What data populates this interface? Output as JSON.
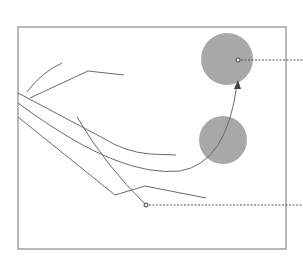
{
  "diagram": {
    "type": "line-drawing",
    "background": "#ffffff",
    "colors": {
      "frame": "#8a8a8a",
      "line": "#6a6a6a",
      "circle_fill": "#a8a8a8",
      "dash": "#555555",
      "dot_stroke": "#333333"
    },
    "frame": {
      "x": 18,
      "y": 27,
      "width": 268,
      "height": 222
    },
    "circles": [
      {
        "name": "upper-circle",
        "cx": 227,
        "cy": 59,
        "r": 26
      },
      {
        "name": "lower-circle",
        "cx": 223,
        "cy": 140,
        "r": 24
      }
    ],
    "lines": [
      {
        "name": "short-curve",
        "d": "M27,92 Q42,72 62,63"
      },
      {
        "name": "bent-polyline-top",
        "d": "M30,98 L88,71 L124,75"
      },
      {
        "name": "upper-sweep-curve",
        "d": "M18,93 L103,138 Q125,152 150,154 L176,155"
      },
      {
        "name": "arrow-curve",
        "d": "M18,103 Q75,145 115,160 Q150,174 180,171 Q227,163 237,84"
      },
      {
        "name": "lower-polyline",
        "d": "M18,117 L115,195 L145,186 L206,198"
      },
      {
        "name": "diagonal-line",
        "d": "M77,117 Q105,165 146,205"
      }
    ],
    "arrow": {
      "name": "arrowhead",
      "tip": [
        238,
        80
      ],
      "direction": "up"
    },
    "callouts": [
      {
        "name": "callout-upper",
        "dot": [
          238,
          60
        ],
        "to_x": 303
      },
      {
        "name": "callout-lower",
        "dot": [
          146,
          205
        ],
        "to_x": 303
      }
    ]
  }
}
